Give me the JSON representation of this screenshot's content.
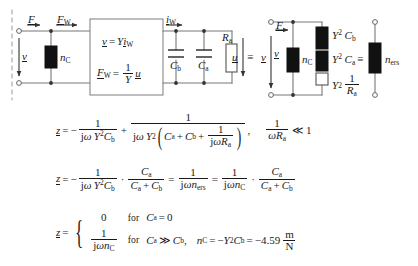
{
  "figure": {
    "type": "electroacoustic-equivalent-circuit-derivation",
    "background": "#ffffff",
    "line_color": "#5a5a5a",
    "fill_black": "#111111",
    "fill_white": "#ffffff"
  },
  "circuit": {
    "left_port": {
      "force_label": "F",
      "force_w_label": "F",
      "force_w_sub": "W",
      "velocity_label": "v",
      "compliance_label": "n",
      "compliance_sub": "C",
      "dashed_divider": true
    },
    "gyrator_box": {
      "eq1": {
        "lhs": "v",
        "rhs_factor": "Y",
        "rhs_var": "i",
        "rhs_sub": "W"
      },
      "eq2": {
        "lhs": "F",
        "lhs_sub": "W",
        "num": "1",
        "den": "Y",
        "rhs_var": "u"
      }
    },
    "rc_network": {
      "current_label": "i",
      "current_sub": "W",
      "cap_b_label": "C",
      "cap_b_sub": "b",
      "cap_a_label": "C",
      "cap_a_sub": "a",
      "res_a_label": "R",
      "res_a_sub": "a",
      "voltage_label": "u",
      "equiv_symbol": "≡",
      "equiv_target": "v"
    },
    "transformed": {
      "force_label": "F",
      "velocity_label": "v",
      "compliance_label": "n",
      "compliance_sub": "C",
      "branch1": {
        "coef": "Y",
        "exp": "2",
        "sym": "C",
        "sub": "b"
      },
      "branch2": {
        "coef": "Y",
        "exp": "2",
        "sym": "C",
        "sub": "a"
      },
      "branch3": {
        "coef": "Y",
        "exp": "2",
        "num": "1",
        "den": "R",
        "den_sub": "a"
      },
      "equiv_symbol": "≡",
      "result_label": "n",
      "result_sub": "ers"
    }
  },
  "equations": {
    "line1": {
      "lhs": "z",
      "eq": "=",
      "minus": "−",
      "t1_num": "1",
      "t1_den_j": "j",
      "t1_den_w": "ω",
      "t1_den_Y": "Y",
      "t1_den_exp": "2",
      "t1_den_C": "C",
      "t1_den_sub": "b",
      "plus": "+",
      "t2_num": "1",
      "t2_den_j": "j",
      "t2_den_w": "ω",
      "t2_den_Y": "Y",
      "t2_den_exp": "2",
      "t2_inner_Ca": "C",
      "t2_inner_Ca_sub": "a",
      "t2_inner_plus": "+",
      "t2_inner_Cb": "C",
      "t2_inner_Cb_sub": "b",
      "t2_inner_plus2": "+",
      "t2_inner_frac_num": "1",
      "t2_inner_frac_den_j": "j",
      "t2_inner_frac_den_w": "ω",
      "t2_inner_frac_den_R": "R",
      "t2_inner_frac_den_sub": "a",
      "comma": ",",
      "cond_num": "1",
      "cond_den_w": "ω",
      "cond_den_R": "R",
      "cond_den_sub": "a",
      "cond_rel": "≪",
      "cond_val": "1"
    },
    "line2": {
      "lhs": "z",
      "eq": "=",
      "minus": "−",
      "a_num": "1",
      "a_den_j": "j",
      "a_den_w": "ω",
      "a_den_Y": "Y",
      "a_den_exp": "2",
      "a_den_C": "C",
      "a_den_sub": "b",
      "dot": "·",
      "b_num_C": "C",
      "b_num_sub": "a",
      "b_den_Ca": "C",
      "b_den_Ca_sub": "a",
      "b_den_plus": "+",
      "b_den_Cb": "C",
      "b_den_Cb_sub": "b",
      "eq2": "=",
      "c_num": "1",
      "c_den_j": "j",
      "c_den_w": "ω",
      "c_den_n": "n",
      "c_den_sub": "ers",
      "eq3": "=",
      "d_num": "1",
      "d_den_j": "j",
      "d_den_w": "ω",
      "d_den_n": "n",
      "d_den_sub": "C",
      "dot2": "·",
      "e_num_C": "C",
      "e_num_sub": "a",
      "e_den_Ca": "C",
      "e_den_Ca_sub": "a",
      "e_den_plus": "+",
      "e_den_Cb": "C",
      "e_den_Cb_sub": "b"
    },
    "line3": {
      "lhs": "z",
      "eq": "=",
      "case1_value": "0",
      "case1_for": "for",
      "case1_var": "C",
      "case1_sub": "a",
      "case1_rel": "=",
      "case1_rhs": "0",
      "case2_num": "1",
      "case2_den_j": "j",
      "case2_den_w": "ω",
      "case2_den_n": "n",
      "case2_den_sub": "C",
      "case2_for": "for",
      "case2_var": "C",
      "case2_sub": "a",
      "case2_rel": "≫",
      "case2_rhs": "C",
      "case2_rhs_sub": "b",
      "comma": ",",
      "result_n": "n",
      "result_n_sub": "C",
      "result_eq": "=",
      "result_minus": "−",
      "result_Y": "Y",
      "result_exp": "2",
      "result_C": "C",
      "result_C_sub": "b",
      "result_eq2": "=",
      "result_value": "−4.59",
      "unit_num": "m",
      "unit_den": "N"
    }
  }
}
